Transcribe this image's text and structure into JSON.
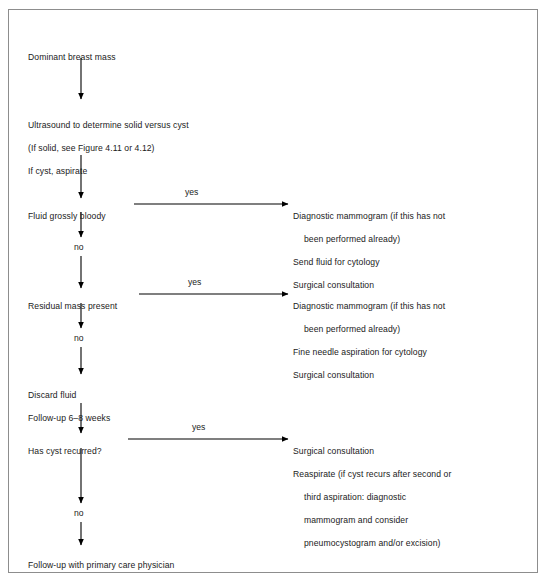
{
  "figure": {
    "type": "clinical-algorithm-flowchart",
    "border_color": "#8d8d8d",
    "text_color": "#1a1a1a",
    "arrow_color": "#000000"
  },
  "nodes": [
    {
      "id": "dominant-breast-mass",
      "lines": [
        {
          "text": "Dominant breast mass",
          "indent": false
        }
      ]
    },
    {
      "id": "ultrasound-step",
      "lines": [
        {
          "text": "Ultrasound to determine solid versus cyst",
          "indent": false
        },
        {
          "text": "(If solid, see Figure 4.11 or 4.12)",
          "indent": false
        },
        {
          "text": "If cyst, aspirate",
          "indent": false
        }
      ]
    },
    {
      "id": "fluid-grossly-bloody",
      "lines": [
        {
          "text": "Fluid grossly bloody",
          "indent": false
        }
      ]
    },
    {
      "id": "bloody-yes-outcome",
      "lines": [
        {
          "text": "Diagnostic mammogram (if this has not",
          "indent": false
        },
        {
          "text": "been performed already)",
          "indent": true
        },
        {
          "text": "Send fluid for cytology",
          "indent": false
        },
        {
          "text": "Surgical consultation",
          "indent": false
        }
      ]
    },
    {
      "id": "residual-mass-present",
      "lines": [
        {
          "text": "Residual mass present",
          "indent": false
        }
      ]
    },
    {
      "id": "residual-yes-outcome",
      "lines": [
        {
          "text": "Diagnostic mammogram (if this has not",
          "indent": false
        },
        {
          "text": "been performed already)",
          "indent": true
        },
        {
          "text": "Fine needle aspiration for cytology",
          "indent": false
        },
        {
          "text": "Surgical consultation",
          "indent": false
        }
      ]
    },
    {
      "id": "discard-fluid",
      "lines": [
        {
          "text": "Discard fluid",
          "indent": false
        },
        {
          "text": "Follow-up 6–8 weeks",
          "indent": false
        }
      ]
    },
    {
      "id": "has-cyst-recurred",
      "lines": [
        {
          "text": "Has cyst recurred?",
          "indent": false
        }
      ]
    },
    {
      "id": "recurred-yes-outcome",
      "lines": [
        {
          "text": "Surgical consultation",
          "indent": false
        },
        {
          "text": "Reaspirate (if cyst recurs after second or",
          "indent": false
        },
        {
          "text": "third aspiration: diagnostic",
          "indent": true
        },
        {
          "text": "mammogram and consider",
          "indent": true
        },
        {
          "text": "pneumocystogram and/or excision)",
          "indent": true
        }
      ]
    },
    {
      "id": "follow-up-pcp",
      "lines": [
        {
          "text": "Follow-up with primary care physician",
          "indent": false
        }
      ]
    }
  ],
  "edge_labels": [
    {
      "id": "yes-bloody",
      "text": "yes"
    },
    {
      "id": "no-bloody",
      "text": "no"
    },
    {
      "id": "yes-residual",
      "text": "yes"
    },
    {
      "id": "no-residual",
      "text": "no"
    },
    {
      "id": "yes-recurred",
      "text": "yes"
    },
    {
      "id": "no-recurred",
      "text": "no"
    }
  ]
}
